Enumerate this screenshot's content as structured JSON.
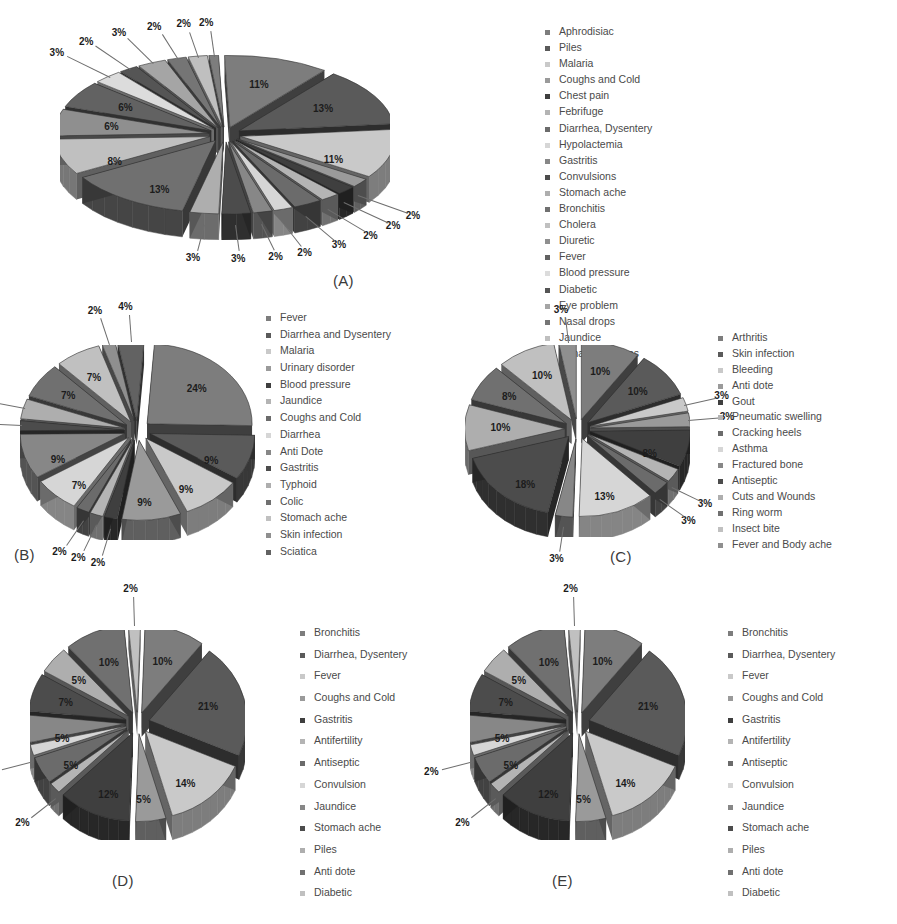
{
  "figure": {
    "background": "#ffffff",
    "panels": [
      "(A)",
      "(B)",
      "(C)",
      "(D)",
      "(E)"
    ]
  },
  "palette": {
    "tones": [
      "#7d7d7d",
      "#5a5a5a",
      "#c9c9c9",
      "#9a9a9a",
      "#3f3f3f",
      "#b4b4b4",
      "#6b6b6b",
      "#d6d6d6",
      "#878787",
      "#4c4c4c",
      "#aeaeae",
      "#707070",
      "#c0c0c0",
      "#8f8f8f",
      "#626262",
      "#dcdcdc",
      "#555555",
      "#a5a5a5",
      "#757575",
      "#bfbfbf"
    ],
    "edge": "#2f2f2f",
    "text": "#1c1c1c",
    "leader": "#6e6e6e"
  },
  "chart_data": [
    {
      "id": "A",
      "type": "pie",
      "title": "(A)",
      "exploded": true,
      "three_d": true,
      "legend_position": "right",
      "categories": [
        "Aphrodisiac",
        "Piles",
        "Malaria",
        "Coughs and Cold",
        "Chest pain",
        "Febrifuge",
        "Diarrhea, Dysentery",
        "Hypolactemia",
        "Gastritis",
        "Convulsions",
        "Stomach ache",
        "Bronchitis",
        "Cholera",
        "Diuretic",
        "Fever",
        "Blood pressure",
        "Diabetic",
        "Eye problem",
        "Nasal drops",
        "Jaundice",
        "Urinary problems"
      ],
      "values": [
        11,
        13,
        11,
        2,
        2,
        2,
        3,
        2,
        2,
        3,
        3,
        13,
        8,
        6,
        6,
        3,
        2,
        3,
        2,
        2,
        1
      ],
      "labels": [
        "11%",
        "13%",
        "11%",
        "2%",
        "2%",
        "2%",
        "3%",
        "2%",
        "2%",
        "3%",
        "3%",
        "13%",
        "8%",
        "6%",
        "6%",
        "3%",
        "2%",
        "3%",
        "2%",
        "2%",
        "2%"
      ]
    },
    {
      "id": "B",
      "type": "pie",
      "title": "(B)",
      "exploded": true,
      "three_d": true,
      "legend_position": "right",
      "categories": [
        "Fever",
        "Diarrhea and Dysentery",
        "Malaria",
        "Urinary disorder",
        "Blood pressure",
        "Jaundice",
        "Coughs and Cold",
        "Diarrhea",
        "Anti Dote",
        "Gastritis",
        "Typhoid",
        "Colic",
        "Stomach ache",
        "Skin infection",
        "Sciatica"
      ],
      "values": [
        24,
        9,
        9,
        9,
        2,
        2,
        2,
        7,
        9,
        2,
        4,
        7,
        7,
        2,
        4
      ],
      "labels": [
        "24%",
        "9%",
        "9%",
        "9%",
        "2%",
        "2%",
        "2%",
        "7%",
        "9%",
        "2%",
        "4%",
        "7%",
        "7%",
        "2%",
        "4%"
      ]
    },
    {
      "id": "C",
      "type": "pie",
      "title": "(C)",
      "exploded": true,
      "three_d": true,
      "legend_position": "right",
      "categories": [
        "Arthritis",
        "Skin infection",
        "Bleeding",
        "Anti dote",
        "Gout",
        "Pneumatic swelling",
        "Cracking heels",
        "Asthma",
        "Fractured bone",
        "Antiseptic",
        "Cuts and Wounds",
        "Ring worm",
        "Insect bite",
        "Fever and Body ache"
      ],
      "values": [
        10,
        10,
        3,
        3,
        8,
        3,
        3,
        13,
        3,
        18,
        10,
        8,
        10,
        3
      ],
      "labels": [
        "10%",
        "10%",
        "3%",
        "3%",
        "8%",
        "3%",
        "3%",
        "13%",
        "3%",
        "18%",
        "10%",
        "8%",
        "10%",
        "3%"
      ]
    },
    {
      "id": "D",
      "type": "pie",
      "title": "(D)",
      "exploded": true,
      "three_d": true,
      "legend_position": "right",
      "categories": [
        "Bronchitis",
        "Diarrhea, Dysentery",
        "Fever",
        "Coughs and Cold",
        "Gastritis",
        "Antifertility",
        "Antiseptic",
        "Convulsion",
        "Jaundice",
        "Stomach ache",
        "Piles",
        "Anti dote",
        "Diabetic"
      ],
      "values": [
        10,
        21,
        14,
        5,
        12,
        2,
        5,
        2,
        5,
        7,
        5,
        10,
        2
      ],
      "labels": [
        "10%",
        "21%",
        "14%",
        "5%",
        "12%",
        "2%",
        "5%",
        "2%",
        "5%",
        "7%",
        "5%",
        "10%",
        "2%"
      ]
    },
    {
      "id": "E",
      "type": "pie",
      "title": "(E)",
      "exploded": true,
      "three_d": true,
      "legend_position": "right",
      "categories": [
        "Bronchitis",
        "Diarrhea, Dysentery",
        "Fever",
        "Coughs and Cold",
        "Gastritis",
        "Antifertility",
        "Antiseptic",
        "Convulsion",
        "Jaundice",
        "Stomach ache",
        "Piles",
        "Anti dote",
        "Diabetic"
      ],
      "values": [
        10,
        21,
        14,
        5,
        12,
        2,
        5,
        2,
        5,
        7,
        5,
        10,
        2
      ],
      "labels": [
        "10%",
        "21%",
        "14%",
        "5%",
        "12%",
        "2%",
        "5%",
        "2%",
        "5%",
        "7%",
        "5%",
        "10%",
        "2%"
      ]
    }
  ]
}
